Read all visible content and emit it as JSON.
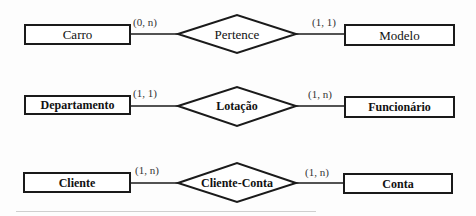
{
  "diagram": {
    "type": "entity-relationship",
    "colors": {
      "stroke": "#1a1a1a",
      "background": "#fdfdfd",
      "text": "#111111"
    },
    "relationships": [
      {
        "left_entity": "Carro",
        "left_cardinality": "(0, n)",
        "relationship": "Pertence",
        "right_cardinality": "(1, 1)",
        "right_entity": "Modelo"
      },
      {
        "left_entity": "Departamento",
        "left_cardinality": "(1, 1)",
        "relationship": "Lotação",
        "right_cardinality": "(1, n)",
        "right_entity": "Funcionário"
      },
      {
        "left_entity": "Cliente",
        "left_cardinality": "(1, n)",
        "relationship": "Cliente-Conta",
        "right_cardinality": "(1, n)",
        "right_entity": "Conta"
      }
    ]
  }
}
